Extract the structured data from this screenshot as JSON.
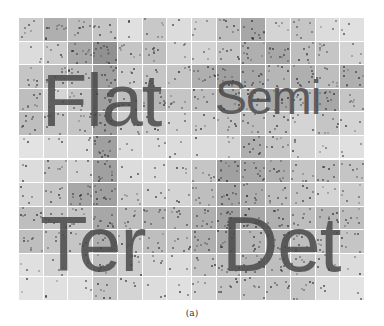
{
  "figure": {
    "caption": "(a)",
    "grid": {
      "columns": 14,
      "rows": 12
    },
    "labels": [
      {
        "text": "Flat",
        "x": 42,
        "y": 64,
        "size": 74
      },
      {
        "text": "Semi",
        "x": 215,
        "y": 74,
        "size": 48
      },
      {
        "text": "Ter",
        "x": 40,
        "y": 205,
        "size": 78
      },
      {
        "text": "Det",
        "x": 222,
        "y": 205,
        "size": 78
      }
    ],
    "cell_shades": [
      [
        0.25,
        0.45,
        0.35,
        0.3,
        0.12,
        0.28,
        0.15,
        0.2,
        0.35,
        0.5,
        0.2,
        0.3,
        0.15,
        0.12
      ],
      [
        0.15,
        0.25,
        0.5,
        0.65,
        0.3,
        0.35,
        0.2,
        0.2,
        0.3,
        0.45,
        0.5,
        0.35,
        0.3,
        0.2
      ],
      [
        0.3,
        0.35,
        0.35,
        0.55,
        0.25,
        0.3,
        0.3,
        0.45,
        0.55,
        0.5,
        0.4,
        0.45,
        0.35,
        0.45
      ],
      [
        0.35,
        0.2,
        0.3,
        0.55,
        0.35,
        0.4,
        0.3,
        0.35,
        0.5,
        0.4,
        0.5,
        0.35,
        0.5,
        0.3
      ],
      [
        0.35,
        0.3,
        0.3,
        0.55,
        0.25,
        0.25,
        0.2,
        0.25,
        0.3,
        0.35,
        0.3,
        0.2,
        0.3,
        0.2
      ],
      [
        0.1,
        0.15,
        0.15,
        0.55,
        0.15,
        0.15,
        0.15,
        0.15,
        0.2,
        0.45,
        0.3,
        0.2,
        0.15,
        0.12
      ],
      [
        0.15,
        0.3,
        0.2,
        0.55,
        0.15,
        0.15,
        0.2,
        0.3,
        0.55,
        0.5,
        0.45,
        0.3,
        0.35,
        0.3
      ],
      [
        0.2,
        0.3,
        0.5,
        0.55,
        0.25,
        0.2,
        0.2,
        0.35,
        0.5,
        0.45,
        0.35,
        0.3,
        0.2,
        0.25
      ],
      [
        0.35,
        0.3,
        0.3,
        0.5,
        0.35,
        0.4,
        0.35,
        0.45,
        0.55,
        0.5,
        0.45,
        0.35,
        0.4,
        0.35
      ],
      [
        0.35,
        0.3,
        0.3,
        0.45,
        0.3,
        0.35,
        0.3,
        0.45,
        0.5,
        0.4,
        0.45,
        0.35,
        0.3,
        0.3
      ],
      [
        0.12,
        0.2,
        0.15,
        0.35,
        0.25,
        0.2,
        0.15,
        0.3,
        0.35,
        0.4,
        0.35,
        0.3,
        0.25,
        0.15
      ],
      [
        0.1,
        0.12,
        0.12,
        0.3,
        0.2,
        0.15,
        0.12,
        0.2,
        0.3,
        0.3,
        0.3,
        0.3,
        0.15,
        0.1
      ]
    ]
  }
}
